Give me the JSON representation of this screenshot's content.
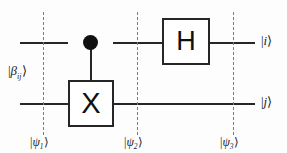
{
  "diagram": {
    "colors": {
      "wire": "#262626",
      "gate_border": "#262626",
      "gate_fill": "#ffffff",
      "control_dot": "#101010",
      "slice_dash": "#7d7d7d",
      "background": "#fdfdfd",
      "text": "#1c1c1c"
    }
  },
  "gates": [
    {
      "name": "cnot-control",
      "symbol": "",
      "wire": "top"
    },
    {
      "name": "cnot-target",
      "symbol": "X",
      "wire": "bottom"
    },
    {
      "name": "hadamard",
      "symbol": "H",
      "wire": "top"
    }
  ],
  "labels": {
    "input": {
      "ket_open": "|",
      "symbol": "β",
      "subscript": "ij",
      "ket_close": "⟩"
    },
    "output_top": {
      "ket_open": "|",
      "symbol": "i",
      "ket_close": "⟩"
    },
    "output_bottom": {
      "ket_open": "|",
      "symbol": "j",
      "ket_close": "⟩"
    },
    "slices": [
      {
        "ket_open": "|",
        "symbol": "ψ",
        "subscript": "1",
        "ket_close": "⟩"
      },
      {
        "ket_open": "|",
        "symbol": "ψ",
        "subscript": "2",
        "ket_close": "⟩"
      },
      {
        "ket_open": "|",
        "symbol": "ψ",
        "subscript": "3",
        "ket_close": "⟩"
      }
    ]
  },
  "wires": [
    {
      "name": "top-wire",
      "label_in": "β_ij",
      "label_out": "i"
    },
    {
      "name": "bottom-wire",
      "label_in": "β_ij",
      "label_out": "j"
    }
  ]
}
